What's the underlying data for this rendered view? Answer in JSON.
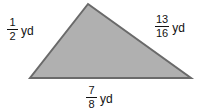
{
  "figure": {
    "background_color": "#ffffff",
    "shape": {
      "name": "triangle",
      "fill_color": "#b0b0b0",
      "stroke_color": "#6a6a6a",
      "stroke_width": 2,
      "vertices": [
        {
          "x": 88,
          "y": 4
        },
        {
          "x": 191,
          "y": 78
        },
        {
          "x": 30,
          "y": 78
        }
      ]
    }
  },
  "labels": {
    "left": {
      "numerator": "1",
      "denominator": "2",
      "unit": "yd",
      "text": "1/2 yd"
    },
    "right": {
      "numerator": "13",
      "denominator": "16",
      "unit": "yd",
      "text": "13/16 yd"
    },
    "bottom": {
      "numerator": "7",
      "denominator": "8",
      "unit": "yd",
      "text": "7/8 yd"
    }
  }
}
